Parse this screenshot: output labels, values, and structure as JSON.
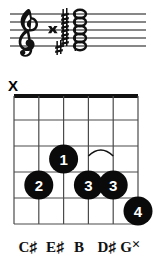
{
  "notation": {
    "clef": "treble-clef",
    "staff_lines": 5,
    "accidentals": [
      {
        "glyph": "double-sharp",
        "symbol": "×"
      },
      {
        "glyph": "sharp",
        "symbol": "♯"
      },
      {
        "glyph": "sharp",
        "symbol": "♯"
      },
      {
        "glyph": "sharp",
        "symbol": "♯"
      },
      {
        "glyph": "sharp",
        "symbol": "♯"
      },
      {
        "glyph": "sharp",
        "symbol": "♯"
      }
    ],
    "noteheads": 5,
    "chord_stack": "cluster"
  },
  "chord_diagram": {
    "strings": 6,
    "frets": 5,
    "nut": true,
    "mute_marker": {
      "label": "X",
      "string": 6
    },
    "fingerings": [
      {
        "finger": "1",
        "string": 4,
        "fret": 3
      },
      {
        "finger": "2",
        "string": 5,
        "fret": 4
      },
      {
        "finger": "3",
        "string": 3,
        "fret": 4
      },
      {
        "finger": "3",
        "string": 2,
        "fret": 4
      },
      {
        "finger": "4",
        "string": 1,
        "fret": 5
      }
    ],
    "barre_arc": {
      "from_string": 3,
      "to_string": 2,
      "fret": 4
    },
    "note_labels": [
      {
        "name": "C",
        "accidental": "♯"
      },
      {
        "name": "E",
        "accidental": "♯"
      },
      {
        "name": "B",
        "accidental": ""
      },
      {
        "name": "D",
        "accidental": "♯"
      },
      {
        "name": "G",
        "accidental": "×"
      }
    ]
  },
  "colors": {
    "ink": "#000000",
    "paper": "#ffffff",
    "grid": "#3a3a3a",
    "dot": "#0a0a0a"
  }
}
